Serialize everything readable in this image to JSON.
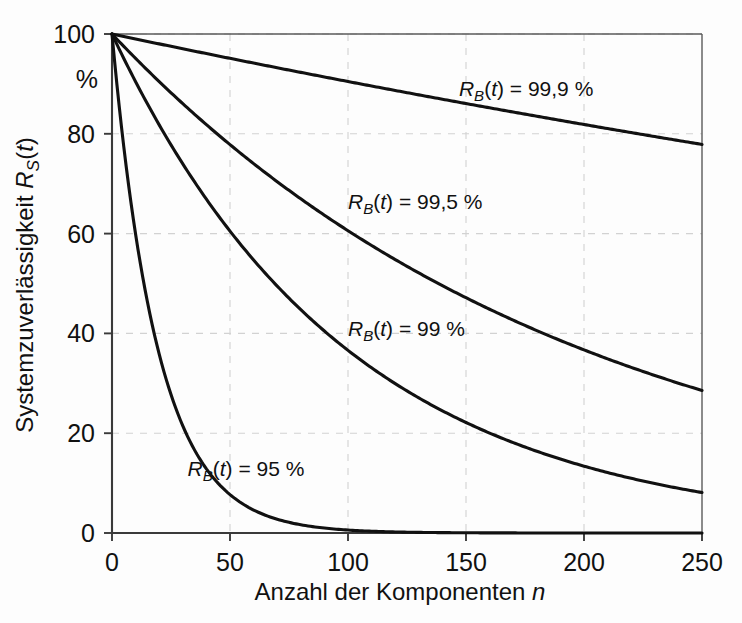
{
  "figure": {
    "background_color": "#fdfdfd",
    "axis_color": "#3a3a3a",
    "curve_color": "#111111",
    "grid_color": "#d2d2d2",
    "y_unit_label": "%"
  },
  "chart_data": {
    "type": "line",
    "title": "",
    "xlabel": "Anzahl der Komponenten n",
    "ylabel": "Systemzuverlässigkeit R_S(t)",
    "xlabel_parts": {
      "text": "Anzahl der Komponenten ",
      "italic_symbol": "n"
    },
    "ylabel_parts": {
      "text": "Systemzuverlässigkeit ",
      "italic_symbol": "R",
      "subscript": "S",
      "suffix_open": "(",
      "suffix_italic": "t",
      "suffix_close": ")"
    },
    "xlim": [
      0,
      250
    ],
    "ylim": [
      0,
      100
    ],
    "xticks": [
      0,
      50,
      100,
      150,
      200,
      250
    ],
    "yticks": [
      0,
      20,
      40,
      60,
      80,
      100
    ],
    "xtick_labels": [
      "0",
      "50",
      "100",
      "150",
      "200",
      "250"
    ],
    "ytick_labels": [
      "0",
      "20",
      "40",
      "60",
      "80",
      "100"
    ],
    "grid": "dashed both axes",
    "legend_position": "inline annotations on curves",
    "x": [
      0,
      10,
      20,
      30,
      40,
      50,
      60,
      70,
      80,
      90,
      100,
      110,
      120,
      130,
      140,
      150,
      160,
      170,
      180,
      190,
      200,
      210,
      220,
      230,
      240,
      250
    ],
    "series": [
      {
        "name": "R_B(t) = 99,9 %",
        "label": "R_B(t) = 99,9 %",
        "label_parts": {
          "italic_symbol": "R",
          "subscript": "B",
          "open": "(",
          "italic_var": "t",
          "close": ")",
          "equals": " = ",
          "value": "99,9 %"
        },
        "reliability": 0.999,
        "values": [
          100.0,
          99.0,
          98.0,
          97.0,
          96.1,
          95.1,
          94.2,
          93.2,
          92.3,
          91.4,
          90.5,
          89.6,
          88.7,
          87.8,
          86.9,
          86.1,
          85.2,
          84.4,
          83.5,
          82.7,
          81.9,
          81.1,
          80.3,
          79.5,
          78.7,
          77.9
        ],
        "label_x": 147,
        "label_y": 87.5
      },
      {
        "name": "R_B(t) = 99,5 %",
        "label": "R_B(t) = 99,5 %",
        "label_parts": {
          "italic_symbol": "R",
          "subscript": "B",
          "open": "(",
          "italic_var": "t",
          "close": ")",
          "equals": " = ",
          "value": "99,5 %"
        },
        "reliability": 0.995,
        "values": [
          100.0,
          95.1,
          90.5,
          86.0,
          81.8,
          77.8,
          74.0,
          70.4,
          66.9,
          63.6,
          60.6,
          57.6,
          54.8,
          52.1,
          49.5,
          47.1,
          44.8,
          42.6,
          40.5,
          38.5,
          36.6,
          34.8,
          33.1,
          31.5,
          30.0,
          28.5
        ],
        "label_x": 100,
        "label_y": 65.0
      },
      {
        "name": "R_B(t) = 99 %",
        "label": "R_B(t) = 99 %",
        "label_parts": {
          "italic_symbol": "R",
          "subscript": "B",
          "open": "(",
          "italic_var": "t",
          "close": ")",
          "equals": " = ",
          "value": "99 %"
        },
        "reliability": 0.99,
        "values": [
          100.0,
          90.4,
          81.8,
          74.0,
          66.9,
          60.5,
          54.7,
          49.5,
          44.8,
          40.5,
          36.6,
          33.1,
          29.9,
          27.1,
          24.5,
          22.2,
          20.0,
          18.1,
          16.4,
          14.8,
          13.4,
          12.1,
          11.0,
          9.9,
          9.0,
          8.1
        ],
        "label_x": 100,
        "label_y": 39.5
      },
      {
        "name": "R_B(t) = 95 %",
        "label": "R_B(t) = 95 %",
        "label_parts": {
          "italic_symbol": "R",
          "subscript": "B",
          "open": "(",
          "italic_var": "t",
          "close": ")",
          "equals": " = ",
          "value": "95 %"
        },
        "reliability": 0.95,
        "values": [
          100.0,
          59.9,
          35.8,
          21.5,
          12.9,
          7.7,
          4.6,
          2.8,
          1.7,
          1.0,
          0.6,
          0.3,
          0.2,
          0.1,
          0.1,
          0.0,
          0.0,
          0.0,
          0.0,
          0.0,
          0.0,
          0.0,
          0.0,
          0.0,
          0.0,
          0.0
        ],
        "label_x": 32,
        "label_y": 11.5
      }
    ]
  }
}
